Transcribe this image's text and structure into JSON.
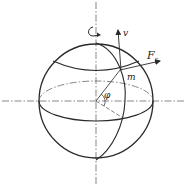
{
  "diagram": {
    "labels": {
      "velocity": "v",
      "force_main": "F",
      "force_sub": "c",
      "mass": "m",
      "angle": "φ"
    },
    "colors": {
      "stroke": "#2a2a2a",
      "background": "#ffffff"
    },
    "geometry": {
      "center": [
        96,
        101
      ],
      "radius": 57,
      "equator_ry": 20,
      "point_m": [
        120,
        70
      ]
    }
  }
}
